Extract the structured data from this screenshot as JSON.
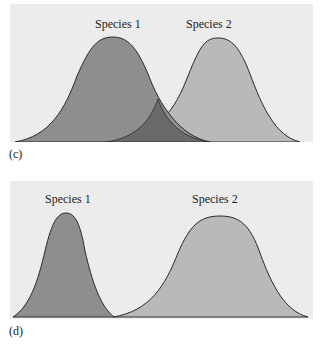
{
  "panels": {
    "c": {
      "letter": "(c)",
      "species1_label": "Species 1",
      "species2_label": "Species 2",
      "description": "Two overlapping bell curves of equal width; overlap region shaded darker"
    },
    "d": {
      "letter": "(d)",
      "species1_label": "Species 1",
      "species2_label": "Species 2",
      "description": "Narrow bell curve for Species 1 and wider bell curve for Species 2, non-overlapping"
    }
  },
  "colors": {
    "background": "#ececec",
    "species1_fill": "#8e8e8e",
    "species2_fill": "#b9b9b9",
    "overlap_fill": "#6a6a6a",
    "outline": "#2a2a2a"
  }
}
